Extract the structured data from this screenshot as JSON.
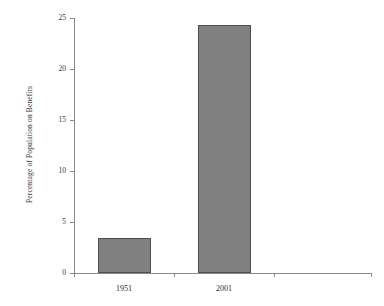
{
  "chart_data": {
    "type": "bar",
    "title": "",
    "xlabel": "",
    "ylabel": "Percentage of Population on Benefits",
    "categories": [
      "1951",
      "2001"
    ],
    "values": [
      3.4,
      24.3
    ],
    "series": [
      {
        "name": "Percentage of Population on Benefits",
        "values": [
          3.4,
          24.3
        ]
      }
    ],
    "ylim": [
      0,
      25
    ],
    "yticks": [
      "0",
      "5",
      "10",
      "15",
      "20",
      "25"
    ],
    "ytick_values": [
      0,
      5,
      10,
      15,
      20,
      25
    ],
    "grid": false,
    "legend": false,
    "legend_position": "none",
    "bar_fill_color": "#808080",
    "bar_edge_color": "#4f4f4f",
    "axis_color": "#8a8a8a"
  }
}
